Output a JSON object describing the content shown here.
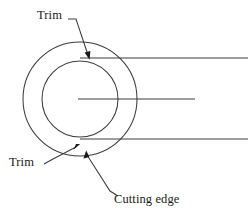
{
  "figure": {
    "background_color": "#ffffff",
    "line_color": "#3c3c3c",
    "text_color": "#1a1a1a"
  },
  "labels": {
    "trim_top": "Trim",
    "trim_bottom": "Trim",
    "cutting_edge": "Cutting edge"
  },
  "geometry": {
    "outer_circle": {
      "cx": 80,
      "cy": 99,
      "r": 57
    },
    "inner_circle": {
      "cx": 80,
      "cy": 99,
      "r": 38
    },
    "horizontal_lines": [
      {
        "name": "top-edge-line",
        "x1": 80,
        "y1": 58,
        "x2": 248,
        "y2": 58
      },
      {
        "name": "center-axis-line",
        "x1": 78,
        "y1": 99,
        "x2": 195,
        "y2": 99
      },
      {
        "name": "bottom-edge-line",
        "x1": 80,
        "y1": 139,
        "x2": 248,
        "y2": 139
      }
    ],
    "leaders": [
      {
        "name": "trim-top-leader",
        "points": "68,19 76,19 89,56",
        "arrow_at": "89,56"
      },
      {
        "name": "trim-bottom-leader",
        "points": "45,163 56,160 79,145",
        "arrow_at": "79,145"
      },
      {
        "name": "cutting-edge-leader",
        "points": "87,152 110,191 119,196",
        "arrow_at": "87,152"
      }
    ]
  }
}
